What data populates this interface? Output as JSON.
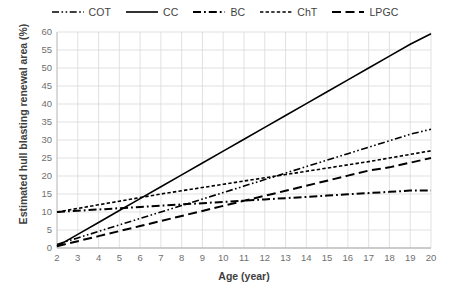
{
  "chart_data": {
    "type": "line",
    "title": "",
    "xlabel": "Age (year)",
    "ylabel": "Estimated hull blasting renewal area (%)",
    "xlim": [
      2,
      20
    ],
    "ylim": [
      0,
      60
    ],
    "xticks": [
      2,
      3,
      4,
      5,
      6,
      7,
      8,
      9,
      10,
      11,
      12,
      13,
      14,
      15,
      16,
      17,
      18,
      19,
      20
    ],
    "yticks": [
      0,
      5,
      10,
      15,
      20,
      25,
      30,
      35,
      40,
      45,
      50,
      55,
      60
    ],
    "xtick_labels": [
      "2",
      "3",
      "4",
      "5",
      "6",
      "7",
      "8",
      "9",
      "10",
      "11",
      "12",
      "13",
      "14",
      "15",
      "16",
      "17",
      "18",
      "19",
      "20"
    ],
    "ytick_labels": [
      "0",
      "5",
      "10",
      "15",
      "20",
      "25",
      "30",
      "35",
      "40",
      "45",
      "50",
      "55",
      "60"
    ],
    "grid": true,
    "grid_color": "#d9d9d9",
    "legend_position": "top-center",
    "x": [
      2,
      3,
      4,
      5,
      6,
      7,
      8,
      9,
      10,
      11,
      12,
      13,
      14,
      15,
      16,
      17,
      18,
      19,
      20
    ],
    "series": [
      {
        "name": "COT",
        "dash_style": "dash-dot-dot",
        "color": "#000000",
        "values": [
          1.0,
          2.8,
          4.6,
          6.4,
          8.2,
          10.0,
          11.8,
          13.6,
          15.4,
          17.2,
          19.0,
          20.8,
          22.6,
          24.4,
          26.2,
          28.0,
          29.8,
          31.6,
          33.0
        ]
      },
      {
        "name": "CC",
        "dash_style": "solid",
        "color": "#000000",
        "values": [
          0.5,
          3.8,
          7.1,
          10.4,
          13.7,
          17.0,
          20.3,
          23.6,
          26.9,
          30.2,
          33.5,
          36.8,
          40.1,
          43.4,
          46.7,
          50.0,
          53.3,
          56.6,
          59.5
        ]
      },
      {
        "name": "BC",
        "dash_style": "dash-dot",
        "color": "#000000",
        "values": [
          10.0,
          10.35,
          10.7,
          11.05,
          11.4,
          11.75,
          12.1,
          12.45,
          12.8,
          13.15,
          13.5,
          13.85,
          14.2,
          14.55,
          14.9,
          15.25,
          15.6,
          15.95,
          16.0
        ]
      },
      {
        "name": "ChT",
        "dash_style": "dashed-fine",
        "color": "#000000",
        "values": [
          10.0,
          11.0,
          12.0,
          13.0,
          14.0,
          15.0,
          15.9,
          16.8,
          17.7,
          18.6,
          19.5,
          20.4,
          21.3,
          22.2,
          23.1,
          24.0,
          25.0,
          26.0,
          27.0
        ]
      },
      {
        "name": "LPGC",
        "dash_style": "long-dash",
        "color": "#000000",
        "values": [
          0.5,
          1.9,
          3.3,
          4.7,
          6.1,
          7.5,
          8.9,
          10.3,
          11.7,
          13.1,
          14.5,
          15.9,
          17.3,
          18.7,
          20.1,
          21.5,
          22.4,
          23.7,
          25.0
        ]
      }
    ]
  },
  "legend": {
    "items": [
      {
        "label": "COT"
      },
      {
        "label": "CC"
      },
      {
        "label": "BC"
      },
      {
        "label": "ChT"
      },
      {
        "label": "LPGC"
      }
    ]
  }
}
